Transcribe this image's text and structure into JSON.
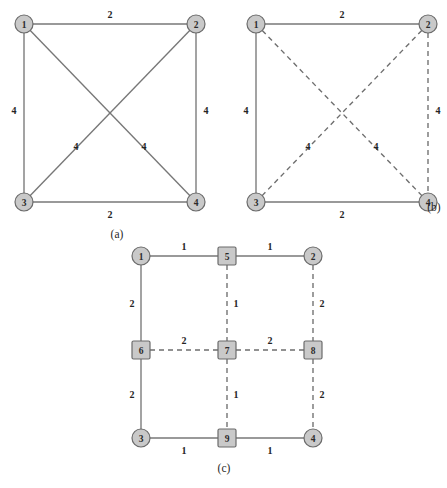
{
  "figure": {
    "background_color": "#ffffff",
    "node_fill_color": "#c9c9c9",
    "node_stroke_color": "#6b6b6b",
    "edge_color": "#777777",
    "panels": [
      {
        "id": "panel-a",
        "caption": "(a)",
        "caption_pos": {
          "x": 117,
          "y": 234
        },
        "description": "Complete graph K4 with all six edges solid",
        "nodes": [
          {
            "id": "1",
            "label": "1",
            "shape": "circle",
            "x": 24,
            "y": 24,
            "r": 9
          },
          {
            "id": "2",
            "label": "2",
            "shape": "circle",
            "x": 196,
            "y": 24,
            "r": 9
          },
          {
            "id": "3",
            "label": "3",
            "shape": "circle",
            "x": 24,
            "y": 202,
            "r": 9
          },
          {
            "id": "4",
            "label": "4",
            "shape": "circle",
            "x": 196,
            "y": 202,
            "r": 9
          }
        ],
        "edges": [
          {
            "from": "1",
            "to": "2",
            "style": "solid",
            "weight": "2",
            "label_x": 110,
            "label_y": 14
          },
          {
            "from": "1",
            "to": "3",
            "style": "solid",
            "weight": "4",
            "label_x": 14,
            "label_y": 110
          },
          {
            "from": "2",
            "to": "4",
            "style": "solid",
            "weight": "4",
            "label_x": 206,
            "label_y": 110
          },
          {
            "from": "3",
            "to": "4",
            "style": "solid",
            "weight": "2",
            "label_x": 110,
            "label_y": 214
          },
          {
            "from": "1",
            "to": "4",
            "style": "solid",
            "weight": "4",
            "label_x": 144,
            "label_y": 146
          },
          {
            "from": "2",
            "to": "3",
            "style": "solid",
            "weight": "4",
            "label_x": 76,
            "label_y": 146
          }
        ]
      },
      {
        "id": "panel-b",
        "caption": "(b)",
        "caption_pos": {
          "x": 434,
          "y": 207
        },
        "description": "Same K4 with spanning tree edges solid and remaining edges dashed",
        "nodes": [
          {
            "id": "1",
            "label": "1",
            "shape": "circle",
            "x": 256,
            "y": 24,
            "r": 9
          },
          {
            "id": "2",
            "label": "2",
            "shape": "circle",
            "x": 428,
            "y": 24,
            "r": 9
          },
          {
            "id": "3",
            "label": "3",
            "shape": "circle",
            "x": 256,
            "y": 202,
            "r": 9
          },
          {
            "id": "4",
            "label": "4",
            "shape": "circle",
            "x": 428,
            "y": 202,
            "r": 9
          }
        ],
        "edges": [
          {
            "from": "1",
            "to": "2",
            "style": "solid",
            "weight": "2",
            "label_x": 342,
            "label_y": 14
          },
          {
            "from": "1",
            "to": "3",
            "style": "solid",
            "weight": "4",
            "label_x": 246,
            "label_y": 110
          },
          {
            "from": "3",
            "to": "4",
            "style": "solid",
            "weight": "2",
            "label_x": 342,
            "label_y": 214
          },
          {
            "from": "2",
            "to": "4",
            "style": "dashed",
            "weight": "4",
            "label_x": 438,
            "label_y": 110
          },
          {
            "from": "1",
            "to": "4",
            "style": "dashed",
            "weight": "4",
            "label_x": 376,
            "label_y": 146
          },
          {
            "from": "2",
            "to": "3",
            "style": "dashed",
            "weight": "4",
            "label_x": 308,
            "label_y": 146
          }
        ]
      },
      {
        "id": "panel-c",
        "caption": "(c)",
        "caption_pos": {
          "x": 224,
          "y": 468
        },
        "description": "Subdivided grid graph with circular corner nodes 1-4 and square mid nodes 5-9",
        "nodes": [
          {
            "id": "1",
            "label": "1",
            "shape": "circle",
            "x": 141,
            "y": 256,
            "r": 9
          },
          {
            "id": "2",
            "label": "2",
            "shape": "circle",
            "x": 313,
            "y": 256,
            "r": 9
          },
          {
            "id": "3",
            "label": "3",
            "shape": "circle",
            "x": 141,
            "y": 438,
            "r": 9
          },
          {
            "id": "4",
            "label": "4",
            "shape": "circle",
            "x": 313,
            "y": 438,
            "r": 9
          },
          {
            "id": "5",
            "label": "5",
            "shape": "square",
            "x": 227,
            "y": 256,
            "r": 9
          },
          {
            "id": "6",
            "label": "6",
            "shape": "square",
            "x": 141,
            "y": 350,
            "r": 9
          },
          {
            "id": "7",
            "label": "7",
            "shape": "square",
            "x": 227,
            "y": 350,
            "r": 9
          },
          {
            "id": "8",
            "label": "8",
            "shape": "square",
            "x": 313,
            "y": 350,
            "r": 9
          },
          {
            "id": "9",
            "label": "9",
            "shape": "square",
            "x": 227,
            "y": 438,
            "r": 9
          }
        ],
        "edges": [
          {
            "from": "1",
            "to": "5",
            "style": "solid",
            "weight": "1",
            "label_x": 184,
            "label_y": 246
          },
          {
            "from": "5",
            "to": "2",
            "style": "solid",
            "weight": "1",
            "label_x": 270,
            "label_y": 246
          },
          {
            "from": "1",
            "to": "6",
            "style": "solid",
            "weight": "2",
            "label_x": 132,
            "label_y": 303
          },
          {
            "from": "6",
            "to": "3",
            "style": "solid",
            "weight": "2",
            "label_x": 132,
            "label_y": 394
          },
          {
            "from": "3",
            "to": "9",
            "style": "solid",
            "weight": "1",
            "label_x": 184,
            "label_y": 450
          },
          {
            "from": "9",
            "to": "4",
            "style": "solid",
            "weight": "1",
            "label_x": 270,
            "label_y": 450
          },
          {
            "from": "5",
            "to": "7",
            "style": "dashed",
            "weight": "1",
            "label_x": 236,
            "label_y": 303
          },
          {
            "from": "2",
            "to": "8",
            "style": "dashed",
            "weight": "2",
            "label_x": 322,
            "label_y": 303
          },
          {
            "from": "6",
            "to": "7",
            "style": "dashed",
            "weight": "2",
            "label_x": 184,
            "label_y": 340
          },
          {
            "from": "7",
            "to": "8",
            "style": "dashed",
            "weight": "2",
            "label_x": 270,
            "label_y": 340
          },
          {
            "from": "7",
            "to": "9",
            "style": "dashed",
            "weight": "1",
            "label_x": 236,
            "label_y": 394
          },
          {
            "from": "8",
            "to": "4",
            "style": "dashed",
            "weight": "2",
            "label_x": 322,
            "label_y": 394
          }
        ]
      }
    ]
  }
}
